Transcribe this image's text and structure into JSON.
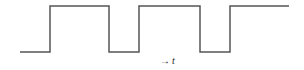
{
  "diagram": {
    "type": "square-wave",
    "line_color": "#555555",
    "line_width": 1.5,
    "levels": {
      "low_y": 52,
      "high_y": 6
    },
    "points": [
      [
        20,
        52
      ],
      [
        50,
        52
      ],
      [
        50,
        6
      ],
      [
        109,
        6
      ],
      [
        109,
        52
      ],
      [
        139,
        52
      ],
      [
        139,
        6
      ],
      [
        200,
        6
      ],
      [
        200,
        52
      ],
      [
        230,
        52
      ],
      [
        230,
        6
      ],
      [
        289,
        6
      ]
    ],
    "axis_label": {
      "arrow": "→",
      "variable": "t"
    }
  }
}
